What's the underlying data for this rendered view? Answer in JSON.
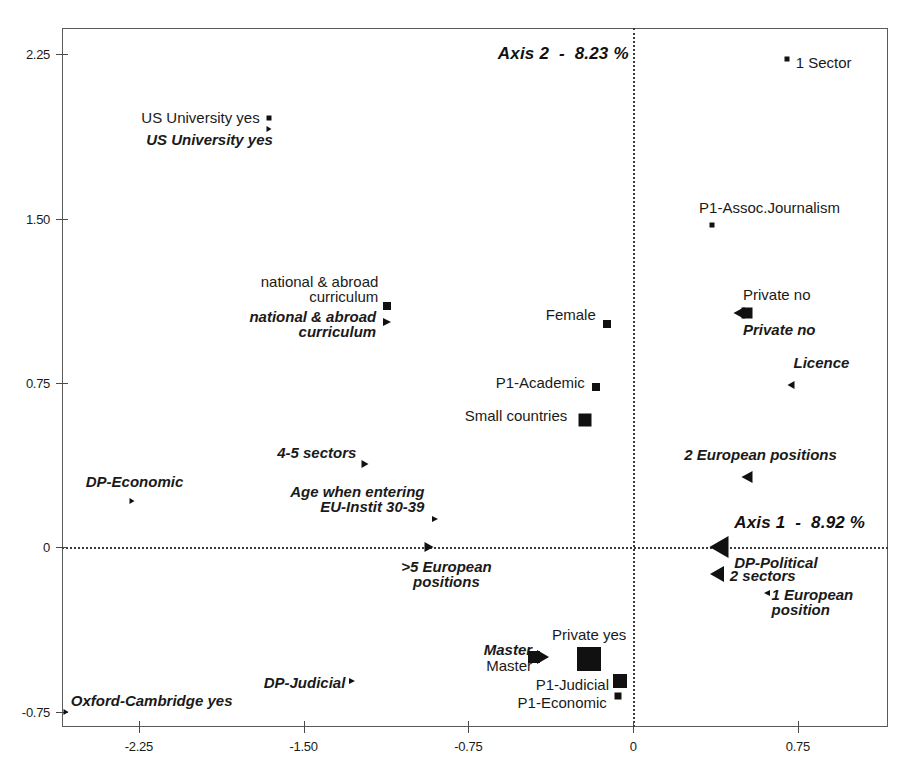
{
  "chart_data": {
    "type": "scatter",
    "title": "",
    "subtitle": "",
    "xlabel": "Axis 1  -  8.92 %",
    "ylabel": "Axis 2  -  8.23 %",
    "xlim": [
      -2.6,
      1.16
    ],
    "ylim": [
      -0.82,
      2.37
    ],
    "xticks": [
      "-2.25",
      "-1.50",
      "-0.75",
      "0",
      "0.75"
    ],
    "xtick_values": [
      -2.25,
      -1.5,
      -0.75,
      0,
      0.75
    ],
    "yticks": [
      "2.25",
      "1.50",
      "0.75",
      "0",
      "-0.75"
    ],
    "ytick_values": [
      2.25,
      1.5,
      0.75,
      0,
      -0.75
    ],
    "grid": false,
    "legend": "none",
    "zero_lines": true,
    "axis_titles": [
      {
        "text": "Axis 2  -  8.23 %",
        "x": -0.02,
        "y": 2.25,
        "align": "align-right"
      },
      {
        "text": "Axis 1  -  8.92 %",
        "x": 0.46,
        "y": 0.11,
        "align": "align-left"
      }
    ],
    "points": [
      {
        "label": "1 Sector",
        "x": 0.7,
        "y": 2.23,
        "style": "passive",
        "marker": "square",
        "size": 5,
        "label_pos": "align-left",
        "lx": 0.74,
        "ly": 2.21
      },
      {
        "label": "US University yes",
        "x": -1.66,
        "y": 1.96,
        "style": "passive",
        "marker": "square",
        "size": 5,
        "label_pos": "align-right",
        "lx": -1.7,
        "ly": 1.96
      },
      {
        "label": "US University yes",
        "x": -1.66,
        "y": 1.91,
        "style": "active",
        "marker": "tri-right",
        "size": 5,
        "label_pos": "align-right",
        "lx": -1.64,
        "ly": 1.86
      },
      {
        "label": "P1-Assoc.Journalism",
        "x": 0.36,
        "y": 1.47,
        "style": "passive",
        "marker": "square",
        "size": 5,
        "label_pos": "align-left",
        "lx": 0.3,
        "ly": 1.55
      },
      {
        "label": "national & abroad\ncurriculum",
        "x": -1.12,
        "y": 1.1,
        "style": "passive",
        "marker": "square",
        "size": 8,
        "label_pos": "align-right",
        "lx": -1.16,
        "ly": 1.18
      },
      {
        "label": "national & abroad\ncurriculum",
        "x": -1.12,
        "y": 1.03,
        "style": "active",
        "marker": "tri-right",
        "size": 8,
        "label_pos": "align-right",
        "lx": -1.17,
        "ly": 1.02
      },
      {
        "label": "Female",
        "x": -0.12,
        "y": 1.02,
        "style": "passive",
        "marker": "square",
        "size": 8,
        "label_pos": "align-right",
        "lx": -0.17,
        "ly": 1.06
      },
      {
        "label": "Private no",
        "x": 0.52,
        "y": 1.07,
        "style": "passive",
        "marker": "square",
        "size": 11,
        "label_pos": "align-left",
        "lx": 0.5,
        "ly": 1.15
      },
      {
        "label": "Private no",
        "x": 0.48,
        "y": 1.07,
        "style": "active",
        "marker": "tri-left",
        "size": 11,
        "label_pos": "align-left",
        "lx": 0.5,
        "ly": 0.99
      },
      {
        "label": "Licence",
        "x": 0.72,
        "y": 0.74,
        "style": "active",
        "marker": "tri-left",
        "size": 7,
        "label_pos": "align-left",
        "lx": 0.73,
        "ly": 0.84
      },
      {
        "label": "P1-Academic",
        "x": -0.17,
        "y": 0.73,
        "style": "passive",
        "marker": "square",
        "size": 8,
        "label_pos": "align-right",
        "lx": -0.22,
        "ly": 0.75
      },
      {
        "label": "Small countries",
        "x": -0.22,
        "y": 0.58,
        "style": "passive",
        "marker": "square",
        "size": 13,
        "label_pos": "align-right",
        "lx": -0.3,
        "ly": 0.6
      },
      {
        "label": "4-5 sectors",
        "x": -1.22,
        "y": 0.38,
        "style": "active",
        "marker": "tri-right",
        "size": 7,
        "label_pos": "align-right",
        "lx": -1.26,
        "ly": 0.43
      },
      {
        "label": "2 European positions",
        "x": 0.52,
        "y": 0.32,
        "style": "active",
        "marker": "tri-left",
        "size": 11,
        "label_pos": "align-center",
        "lx": 0.58,
        "ly": 0.42
      },
      {
        "label": "DP-Economic",
        "x": -2.28,
        "y": 0.21,
        "style": "active",
        "marker": "tri-right",
        "size": 5,
        "label_pos": "align-center",
        "lx": -2.27,
        "ly": 0.3
      },
      {
        "label": "Age when entering\nEU-Instit 30-39",
        "x": -0.9,
        "y": 0.13,
        "style": "active",
        "marker": "tri-right",
        "size": 6,
        "label_pos": "align-right",
        "lx": -0.95,
        "ly": 0.22
      },
      {
        "label": "DP-Political",
        "x": 0.39,
        "y": 0.0,
        "style": "active",
        "marker": "tri-left",
        "size": 19,
        "label_pos": "align-left",
        "lx": 0.46,
        "ly": -0.07
      },
      {
        "label": ">5 European\npositions",
        "x": -0.93,
        "y": 0.0,
        "style": "active",
        "marker": "tri-right",
        "size": 9,
        "label_pos": "align-center",
        "lx": -0.85,
        "ly": -0.12
      },
      {
        "label": "2 sectors",
        "x": 0.38,
        "y": -0.12,
        "style": "active",
        "marker": "tri-left",
        "size": 14,
        "label_pos": "align-left",
        "lx": 0.44,
        "ly": -0.13
      },
      {
        "label": "1 European\nposition",
        "x": 0.61,
        "y": -0.21,
        "style": "active",
        "marker": "tri-left",
        "size": 6,
        "label_pos": "align-left",
        "lx": 0.63,
        "ly": -0.25
      },
      {
        "label": "Private yes",
        "x": -0.2,
        "y": -0.51,
        "style": "passive",
        "marker": "square",
        "size": 24,
        "label_pos": "align-center",
        "lx": -0.2,
        "ly": -0.4
      },
      {
        "label": "Master",
        "x": -0.41,
        "y": -0.5,
        "style": "active",
        "marker": "tri-right",
        "size": 12,
        "label_pos": "align-right",
        "lx": -0.46,
        "ly": -0.47
      },
      {
        "label": "Master",
        "x": -0.45,
        "y": -0.5,
        "style": "passive",
        "marker": "square",
        "size": 12,
        "label_pos": "align-right",
        "lx": -0.46,
        "ly": -0.54
      },
      {
        "label": "DP-Judicial",
        "x": -1.28,
        "y": -0.61,
        "style": "active",
        "marker": "tri-right",
        "size": 6,
        "label_pos": "align-right",
        "lx": -1.31,
        "ly": -0.62
      },
      {
        "label": "P1-Judicial",
        "x": -0.06,
        "y": -0.61,
        "style": "passive",
        "marker": "square",
        "size": 14,
        "label_pos": "align-right",
        "lx": -0.11,
        "ly": -0.63
      },
      {
        "label": "P1-Economic",
        "x": -0.07,
        "y": -0.68,
        "style": "passive",
        "marker": "square",
        "size": 7,
        "label_pos": "align-right",
        "lx": -0.12,
        "ly": -0.71
      },
      {
        "label": "Oxford-Cambridge yes",
        "x": -2.58,
        "y": -0.75,
        "style": "active",
        "marker": "tri-right",
        "size": 5,
        "label_pos": "align-left",
        "lx": -2.56,
        "ly": -0.7
      }
    ]
  },
  "figure": {
    "plot_left_px": 62,
    "plot_top_px": 28,
    "plot_right_px": 888,
    "plot_bottom_px": 727
  }
}
